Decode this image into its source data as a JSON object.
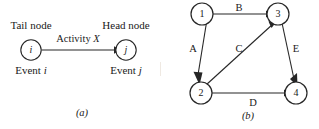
{
  "figure": {
    "panel_a": {
      "caption": "(a)",
      "tail_label": "Tail node",
      "head_label": "Head node",
      "activity_label": "Activity",
      "activity_symbol": "X",
      "tail_event_label": "Event",
      "tail_event_symbol": "i",
      "head_event_label": "Event",
      "head_event_symbol": "j",
      "tail_node_text": "i",
      "head_node_text": "j"
    },
    "panel_b": {
      "caption": "(b)",
      "nodes": [
        {
          "id": "1",
          "label": "1"
        },
        {
          "id": "2",
          "label": "2"
        },
        {
          "id": "3",
          "label": "3"
        },
        {
          "id": "4",
          "label": "4"
        }
      ],
      "edges": [
        {
          "label": "A",
          "from": "1",
          "to": "2"
        },
        {
          "label": "B",
          "from": "1",
          "to": "3"
        },
        {
          "label": "C",
          "from": "2",
          "to": "3"
        },
        {
          "label": "D",
          "from": "2",
          "to": "4"
        },
        {
          "label": "E",
          "from": "3",
          "to": "4"
        }
      ]
    }
  },
  "colors": {
    "ink": "#1a1a1a",
    "stroke": "#262626",
    "background": "#ffffff",
    "divider": "#efe9e2"
  }
}
